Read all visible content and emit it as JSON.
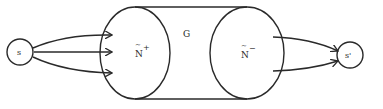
{
  "diagram": {
    "type": "flow-network",
    "colors": {
      "stroke": "#2a2a2a",
      "background": "#ffffff"
    },
    "nodes": {
      "source": {
        "label": "s"
      },
      "sink": {
        "label": "s'"
      },
      "left_set": {
        "label": "N",
        "accent": "~",
        "superscript": "+"
      },
      "right_set": {
        "label": "N",
        "accent": "~",
        "superscript": "−"
      },
      "region": {
        "label": "G"
      }
    },
    "edges": [
      {
        "from": "s",
        "to": "N+",
        "count": 3
      },
      {
        "from": "N-",
        "to": "s'",
        "count": 2
      }
    ]
  }
}
